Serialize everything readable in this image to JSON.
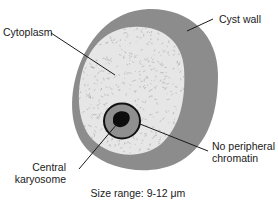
{
  "figure": {
    "subject": "cyst",
    "labels": {
      "cyst_wall": "Cyst wall",
      "cytoplasm": "Cytoplasm",
      "no_peripheral_chromatin_line1": "No peripheral",
      "no_peripheral_chromatin_line2": "chromatin",
      "central_karyosome_line1": "Central",
      "central_karyosome_line2": "karyosome"
    },
    "caption": "Size range: 9-12 μm"
  },
  "colors": {
    "cyst_wall": "#8c8c8c",
    "cytoplasm": "#e6e6e6",
    "cytoplasm_speckle": "#a8a8a8",
    "nucleus": "#8f8f8f",
    "nucleus_outline": "#111111",
    "karyosome": "#0d0d0d",
    "leader_line": "#1a1a1a",
    "text": "#1a1a1a"
  }
}
